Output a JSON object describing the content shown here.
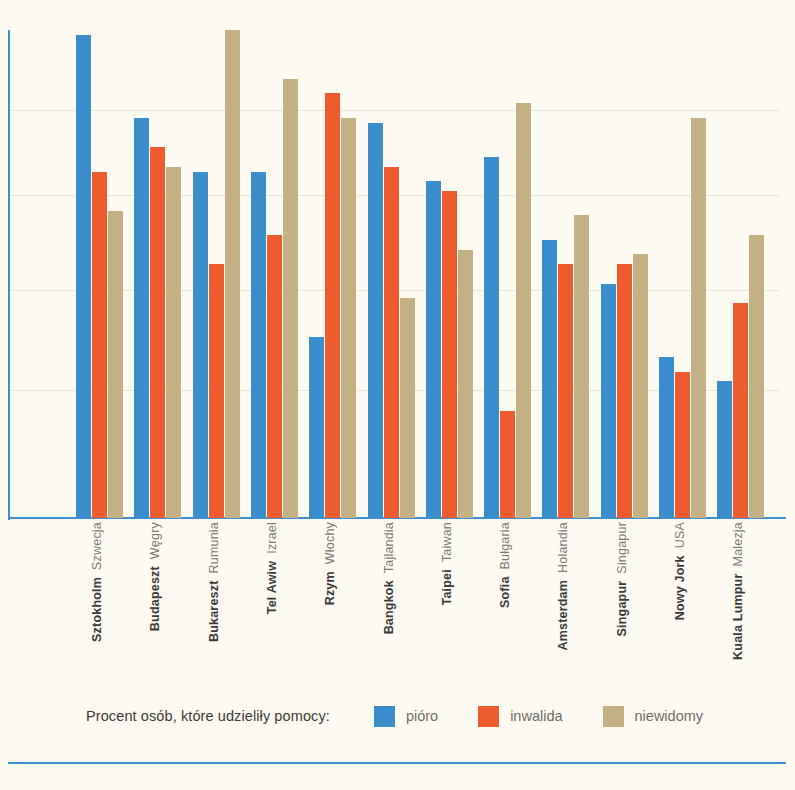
{
  "chart_data": {
    "type": "bar",
    "title": "",
    "xlabel": "",
    "ylabel": "",
    "ylim": [
      0,
      100
    ],
    "grid": false,
    "legend_position": "bottom",
    "legend_title": "Procent osób, które udzieliły pomocy:",
    "categories": [
      "Sztokholm",
      "Budapeszt",
      "Bukareszt",
      "Tel Awiw",
      "Rzym",
      "Bangkok",
      "Taipei",
      "Sofia",
      "Amsterdam",
      "Singapur",
      "Nowy Jork",
      "Kuala Lumpur"
    ],
    "subcategories": [
      "Szwecja",
      "Węgry",
      "Rumunia",
      "Izrael",
      "Włochy",
      "Tajlandia",
      "Taiwan",
      "Bułgaria",
      "Holandia",
      "Singapur",
      "USA",
      "Malezja"
    ],
    "series": [
      {
        "name": "pióro",
        "color": "#3a8ecb",
        "values": [
          99,
          82,
          71,
          71,
          37,
          81,
          69,
          74,
          57,
          48,
          33,
          28
        ]
      },
      {
        "name": "inwalida",
        "color": "#ee5b2e",
        "values": [
          71,
          76,
          52,
          58,
          87,
          72,
          67,
          22,
          52,
          52,
          30,
          44
        ]
      },
      {
        "name": "niewidomy",
        "color": "#c4b183",
        "values": [
          63,
          72,
          100,
          90,
          82,
          45,
          55,
          85,
          62,
          54,
          82,
          58
        ]
      }
    ]
  },
  "legend": {
    "title": "Procent osób, które udzieliły pomocy:",
    "items": [
      {
        "label": "pióro",
        "color": "#3a8ecb",
        "swatch": "pioro"
      },
      {
        "label": "inwalida",
        "color": "#ee5b2e",
        "swatch": "inwalida"
      },
      {
        "label": "niewidomy",
        "color": "#c4b183",
        "swatch": "niewidomy"
      }
    ]
  },
  "colors": {
    "background": "#fdfaf1",
    "axis": "#3f8fd0",
    "city_text": "#3b3a38",
    "country_text": "#7d7a72",
    "pioro": "#3a8ecb",
    "inwalida": "#ee5b2e",
    "niewidomy": "#c4b183"
  }
}
